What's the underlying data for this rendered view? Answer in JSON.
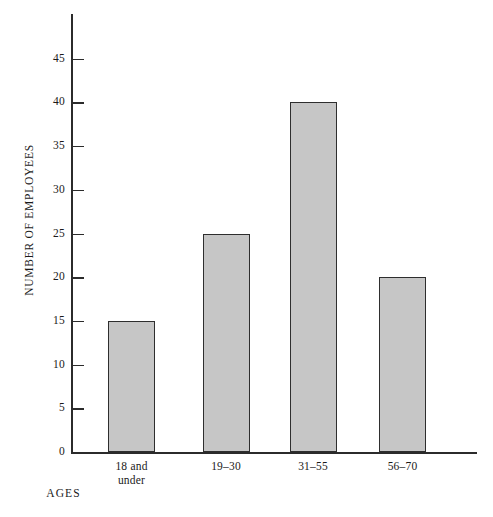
{
  "chart_data": {
    "type": "bar",
    "title": "",
    "subtitle": "",
    "xlabel": "AGES",
    "ylabel": "NUMBER OF EMPLOYEES",
    "categories": [
      "18 and under",
      "19–30",
      "31–55",
      "56–70"
    ],
    "category_lines": [
      [
        "18 and",
        "under"
      ],
      [
        "19–30",
        ""
      ],
      [
        "31–55",
        ""
      ],
      [
        "56–70",
        ""
      ]
    ],
    "values": [
      15,
      25,
      40,
      20
    ],
    "ylim": [
      0,
      47
    ],
    "yticks": [
      0,
      5,
      10,
      15,
      20,
      25,
      30,
      35,
      40,
      45
    ],
    "ytick_labels": [
      "0",
      "5",
      "10",
      "15",
      "20",
      "25",
      "30",
      "35",
      "40",
      "45"
    ],
    "grid": false,
    "legend": null,
    "bar_fill_color": "#c6c6c6",
    "bar_edge_color": "#2e2e2e",
    "axis_color": "#2b2b2b",
    "background_color": "#ffffff"
  }
}
